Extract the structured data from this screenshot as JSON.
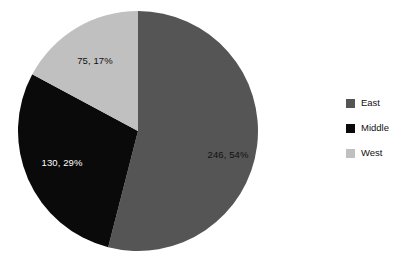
{
  "chart_data": {
    "type": "pie",
    "title": "",
    "categories": [
      "East",
      "Middle",
      "West"
    ],
    "values": [
      246,
      130,
      75
    ],
    "percentages": [
      54,
      29,
      17
    ],
    "data_labels": [
      "246, 54%",
      "130, 29%",
      "75, 17%"
    ],
    "colors": [
      "#555555",
      "#0a0a0a",
      "#c0c0c0"
    ],
    "total": 451,
    "start_angle_deg": 0,
    "direction": "clockwise",
    "legend_position": "right",
    "grid": false,
    "background": "#ffffff",
    "slices": [
      {
        "name": "East",
        "value": 246,
        "percent": 54,
        "label": "246, 54%",
        "color": "#555555",
        "label_color": "#111111",
        "start_deg": 0,
        "end_deg": 194.4,
        "label_x": 228,
        "label_y": 158
      },
      {
        "name": "Middle",
        "value": 130,
        "percent": 29,
        "label": "130, 29%",
        "color": "#0a0a0a",
        "label_color": "#ffffff",
        "start_deg": 194.4,
        "end_deg": 298.2,
        "label_x": 62,
        "label_y": 166
      },
      {
        "name": "West",
        "value": 75,
        "percent": 17,
        "label": "75, 17%",
        "color": "#c0c0c0",
        "label_color": "#111111",
        "start_deg": 298.2,
        "end_deg": 360,
        "label_x": 95,
        "label_y": 64
      }
    ],
    "geometry": {
      "center_x": 138,
      "center_y": 131,
      "radius": 120
    }
  },
  "legend": {
    "items": [
      {
        "label": "East",
        "color": "#555555"
      },
      {
        "label": "Middle",
        "color": "#0a0a0a"
      },
      {
        "label": "West",
        "color": "#c0c0c0"
      }
    ]
  }
}
